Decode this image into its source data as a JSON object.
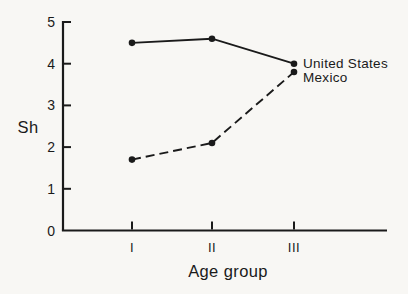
{
  "chart_data": {
    "type": "line",
    "title": "",
    "xlabel": "Age group",
    "ylabel": "Sh",
    "categories": [
      "I",
      "II",
      "III"
    ],
    "series": [
      {
        "name": "United States",
        "style": "solid",
        "values": [
          4.5,
          4.6,
          4.0
        ]
      },
      {
        "name": "Mexico",
        "style": "dashed",
        "values": [
          1.7,
          2.1,
          3.8
        ]
      }
    ],
    "ylim": [
      0,
      5
    ],
    "yticks": [
      0,
      1,
      2,
      3,
      4,
      5
    ],
    "grid": false,
    "legend_position": "right-of-last-point"
  },
  "colors": {
    "background": "#f8f7f4",
    "ink": "#1a1a1a"
  }
}
